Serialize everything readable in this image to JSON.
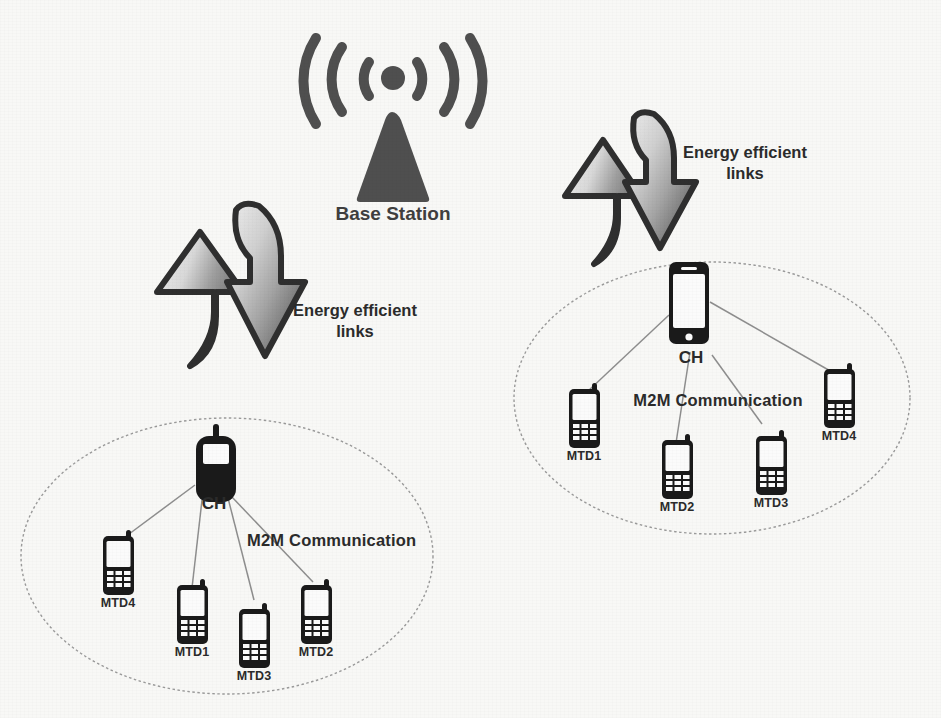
{
  "diagram": {
    "background_color": "#f8f8f6",
    "base_station": {
      "label": "Base Station",
      "icon": "antenna-tower-icon",
      "color": "#4f4f4f",
      "x": 390,
      "y": 120
    },
    "energy_links": [
      {
        "id": "energy-link-left",
        "label_line1": "Energy efficient",
        "label_line2": "links",
        "label_x": 355,
        "label_y": 300,
        "up_arrow": {
          "icon": "curved-up-arrow-icon",
          "x": 150,
          "y": 230
        },
        "down_arrow": {
          "icon": "curved-down-arrow-icon",
          "x": 225,
          "y": 215
        },
        "arrow_fill_light": "#e2e2e2",
        "arrow_fill_dark": "#8d8d8d",
        "arrow_outline": "#2f2f2f"
      },
      {
        "id": "energy-link-right",
        "label_line1": "Energy efficient",
        "label_line2": "links",
        "label_x": 740,
        "label_y": 142,
        "up_arrow": {
          "icon": "curved-up-arrow-icon",
          "x": 560,
          "y": 140
        },
        "down_arrow": {
          "icon": "curved-down-arrow-icon",
          "x": 614,
          "y": 120
        },
        "arrow_fill_light": "#e2e2e2",
        "arrow_fill_dark": "#8d8d8d",
        "arrow_outline": "#2f2f2f"
      }
    ],
    "clusters": [
      {
        "id": "cluster-left",
        "ellipse": {
          "cx": 227,
          "cy": 556,
          "rx": 206,
          "ry": 138,
          "stroke": "#9a9a9a"
        },
        "m2m_label": "M2M Communication",
        "m2m_x": 247,
        "m2m_y": 538,
        "cluster_head": {
          "label": "CH",
          "icon": "feature-phone-icon",
          "x": 198,
          "y": 440,
          "w": 38,
          "h": 62,
          "label_x": 210,
          "label_y": 505
        },
        "members": [
          {
            "label": "MTD4",
            "icon": "keypad-phone-icon",
            "x": 103,
            "y": 534,
            "w": 31,
            "h": 59,
            "label_x": 118,
            "label_y": 598
          },
          {
            "label": "MTD1",
            "icon": "keypad-phone-icon",
            "x": 177,
            "y": 583,
            "w": 31,
            "h": 59,
            "label_x": 192,
            "label_y": 647
          },
          {
            "label": "MTD3",
            "icon": "keypad-phone-icon",
            "x": 239,
            "y": 607,
            "w": 31,
            "h": 59,
            "label_x": 254,
            "label_y": 671
          },
          {
            "label": "MTD2",
            "icon": "keypad-phone-icon",
            "x": 301,
            "y": 583,
            "w": 31,
            "h": 59,
            "label_x": 316,
            "label_y": 647
          }
        ],
        "links": [
          {
            "from": "cluster-head",
            "to": "MTD4",
            "x1": 195,
            "y1": 485,
            "x2": 121,
            "y2": 540
          },
          {
            "from": "cluster-head",
            "to": "MTD1",
            "x1": 202,
            "y1": 500,
            "x2": 192,
            "y2": 588
          },
          {
            "from": "cluster-head",
            "to": "MTD3",
            "x1": 228,
            "y1": 498,
            "x2": 254,
            "y2": 600
          },
          {
            "from": "cluster-head",
            "to": "MTD2",
            "x1": 231,
            "y1": 496,
            "x2": 313,
            "y2": 582
          }
        ]
      },
      {
        "id": "cluster-right",
        "ellipse": {
          "cx": 712,
          "cy": 398,
          "rx": 198,
          "ry": 136,
          "stroke": "#9a9a9a"
        },
        "m2m_label": "M2M Communication",
        "m2m_x": 718,
        "m2m_y": 398,
        "cluster_head": {
          "label": "CH",
          "icon": "smartphone-icon",
          "x": 669,
          "y": 262,
          "w": 38,
          "h": 82,
          "label_x": 688,
          "label_y": 350
        },
        "members": [
          {
            "label": "MTD1",
            "icon": "keypad-phone-icon",
            "x": 569,
            "y": 387,
            "w": 31,
            "h": 59,
            "label_x": 584,
            "label_y": 451
          },
          {
            "label": "MTD2",
            "icon": "keypad-phone-icon",
            "x": 662,
            "y": 438,
            "w": 31,
            "h": 59,
            "label_x": 677,
            "label_y": 502
          },
          {
            "label": "MTD3",
            "icon": "keypad-phone-icon",
            "x": 756,
            "y": 434,
            "w": 31,
            "h": 59,
            "label_x": 771,
            "label_y": 498
          },
          {
            "label": "MTD4",
            "icon": "keypad-phone-icon",
            "x": 824,
            "y": 367,
            "w": 31,
            "h": 59,
            "label_x": 839,
            "label_y": 431
          }
        ],
        "links": [
          {
            "from": "cluster-head",
            "to": "MTD1",
            "x1": 669,
            "y1": 315,
            "x2": 587,
            "y2": 392
          },
          {
            "from": "cluster-head",
            "to": "MTD2",
            "x1": 690,
            "y1": 352,
            "x2": 676,
            "y2": 443
          },
          {
            "from": "cluster-head",
            "to": "MTD3",
            "x1": 712,
            "y1": 355,
            "x2": 762,
            "y2": 424
          },
          {
            "from": "cluster-head",
            "to": "MTD4",
            "x1": 710,
            "y1": 302,
            "x2": 832,
            "y2": 372
          }
        ]
      }
    ]
  }
}
